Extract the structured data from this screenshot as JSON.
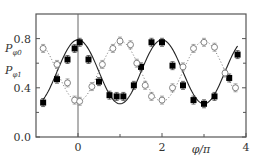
{
  "chart_data": {
    "type": "scatter",
    "title": "",
    "xlabel": "φ/π",
    "ylabel": "",
    "xlim": [
      -1,
      4
    ],
    "ylim": [
      0,
      1
    ],
    "x_ticks": [
      0,
      2,
      4
    ],
    "x_tick_labels": [
      "0",
      "2",
      "4"
    ],
    "x_minor_ticks": [
      1,
      3
    ],
    "y_ticks": [
      0.0,
      0.4,
      0.8
    ],
    "y_tick_labels": [
      "0.0",
      "0.4",
      "0.8"
    ],
    "y_minor_ticks": [
      0.2,
      0.6
    ],
    "grid": false,
    "vertical_reference_line": 0,
    "legend_position": "left, inline with y-axis labels",
    "legend": [
      "P_φ0",
      "P_φ1"
    ],
    "series": [
      {
        "name": "P_φ0",
        "marker": "filled-square",
        "fit_line": "solid",
        "color": "#000000",
        "x": [
          -0.83,
          -0.5,
          -0.25,
          -0.08,
          0.04,
          0.25,
          0.5,
          0.75,
          0.92,
          1.08,
          1.33,
          1.5,
          1.75,
          2.0,
          2.25,
          2.5,
          2.75,
          3.0,
          3.25,
          3.6,
          3.8
        ],
        "values": [
          0.28,
          0.47,
          0.63,
          0.72,
          0.77,
          0.63,
          0.45,
          0.34,
          0.33,
          0.33,
          0.42,
          0.57,
          0.77,
          0.77,
          0.58,
          0.42,
          0.3,
          0.27,
          0.33,
          0.48,
          0.67
        ],
        "fit": {
          "form": "A + B*cos(pi*x)",
          "A": 0.53,
          "B": 0.26
        }
      },
      {
        "name": "P_φ1",
        "marker": "open-circle",
        "fit_line": "dotted",
        "color": "#555555",
        "x": [
          -0.83,
          -0.5,
          -0.25,
          -0.08,
          0.04,
          0.33,
          0.58,
          0.83,
          1.0,
          1.25,
          1.4,
          1.6,
          1.75,
          2.0,
          2.25,
          2.5,
          2.75,
          3.0,
          3.25,
          3.5,
          3.75
        ],
        "values": [
          0.72,
          0.59,
          0.44,
          0.3,
          0.29,
          0.41,
          0.59,
          0.72,
          0.78,
          0.75,
          0.6,
          0.42,
          0.33,
          0.3,
          0.4,
          0.57,
          0.72,
          0.77,
          0.73,
          0.52,
          0.4
        ],
        "fit": {
          "form": "A - B*cos(pi*x)",
          "A": 0.535,
          "B": 0.245
        }
      }
    ]
  },
  "labels": {
    "legend_p0_main": "P",
    "legend_p0_sub": "φ0",
    "legend_p1_main": "P",
    "legend_p1_sub": "φ1",
    "xlabel": "φ/π"
  }
}
